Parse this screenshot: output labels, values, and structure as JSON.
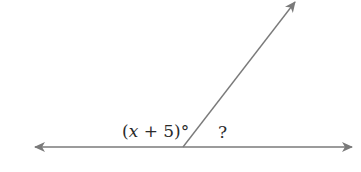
{
  "diagram": {
    "type": "supplementary-angles",
    "lines": {
      "horizontal_line": {
        "x1": 35,
        "y1": 147,
        "x2": 352,
        "y2": 147,
        "arrows": "both"
      },
      "ray": {
        "x1": 183,
        "y1": 147,
        "x2": 296,
        "y2": 1,
        "arrows": "end"
      }
    },
    "colors": {
      "line": "#7a7a7a",
      "text": "#2a2a2a",
      "background": "#ffffff"
    },
    "labels": {
      "angle_left": {
        "open_paren": "(",
        "variable": "x",
        "rest": " + 5)°"
      },
      "angle_right": "?"
    }
  }
}
